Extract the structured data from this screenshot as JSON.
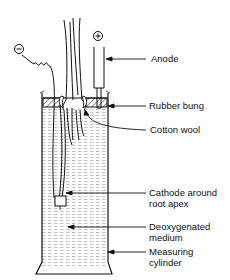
{
  "diagram": {
    "labels": {
      "anode": "Anode",
      "rubber_bung": "Rubber bung",
      "cotton_wool": "Cotton wool",
      "cathode_line1": "Cathode around",
      "cathode_line2": "root apex",
      "medium_line1": "Deoxygenated",
      "medium_line2": "medium",
      "cylinder_line1": "Measuring",
      "cylinder_line2": "cylinder"
    },
    "symbols": {
      "negative": "−",
      "positive": "+"
    },
    "colors": {
      "ink": "#111111",
      "medium_hatch": "#9a9a9a",
      "background": "#ffffff"
    }
  }
}
